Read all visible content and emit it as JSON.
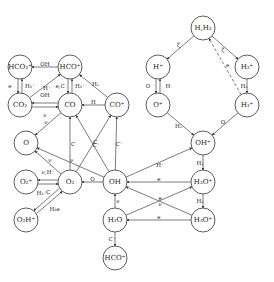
{
  "nodes": [
    {
      "id": "HCO2p",
      "label": "HCO₂⁺",
      "x": 20,
      "y": 67
    },
    {
      "id": "HCOp",
      "label": "HCO⁺",
      "x": 70,
      "y": 67
    },
    {
      "id": "CO2",
      "label": "CO₂",
      "x": 20,
      "y": 105
    },
    {
      "id": "CO",
      "label": "CO",
      "x": 70,
      "y": 105
    },
    {
      "id": "COp",
      "label": "CO⁺",
      "x": 117,
      "y": 105
    },
    {
      "id": "O",
      "label": "O",
      "x": 26,
      "y": 143
    },
    {
      "id": "O2p",
      "label": "O₂⁺",
      "x": 26,
      "y": 182
    },
    {
      "id": "O2",
      "label": "O₂",
      "x": 70,
      "y": 182
    },
    {
      "id": "O2Hp",
      "label": "O₂H⁺",
      "x": 26,
      "y": 220
    },
    {
      "id": "OH",
      "label": "OH",
      "x": 115,
      "y": 182
    },
    {
      "id": "H2O",
      "label": "H₂O",
      "x": 115,
      "y": 220
    },
    {
      "id": "HCOp2",
      "label": "HCO⁺",
      "x": 115,
      "y": 258
    },
    {
      "id": "HH2",
      "label": "H,H₂",
      "x": 203,
      "y": 28
    },
    {
      "id": "Hp",
      "label": "H⁺",
      "x": 158,
      "y": 67
    },
    {
      "id": "H2p",
      "label": "H₂⁺",
      "x": 247,
      "y": 67
    },
    {
      "id": "Op",
      "label": "O⁺",
      "x": 158,
      "y": 105
    },
    {
      "id": "H3p",
      "label": "H₃⁺",
      "x": 247,
      "y": 105
    },
    {
      "id": "OHp",
      "label": "OH⁺",
      "x": 203,
      "y": 143
    },
    {
      "id": "H2Op",
      "label": "H₂O⁺",
      "x": 203,
      "y": 182
    },
    {
      "id": "H3Op",
      "label": "H₃O⁺",
      "x": 203,
      "y": 220
    }
  ],
  "edges": [
    {
      "from": "HCOp",
      "to": "HCO2p",
      "label": "OH"
    },
    {
      "from": "HCO2p",
      "to": "CO2",
      "label": "e"
    },
    {
      "from": "CO2",
      "to": "HCO2p",
      "label": "H₃⁺"
    },
    {
      "from": "CO2",
      "to": "HCOp",
      "label": "H⁺"
    },
    {
      "from": "HCOp",
      "to": "CO",
      "label": "e,C"
    },
    {
      "from": "CO",
      "to": "HCOp",
      "label": "H₃⁺"
    },
    {
      "from": "COp",
      "to": "HCOp",
      "label": "H₂"
    },
    {
      "from": "CO",
      "to": "CO2",
      "label": "OH"
    },
    {
      "from": "CO2",
      "to": "CO",
      "label": "ν"
    },
    {
      "from": "COp",
      "to": "CO",
      "label": "H"
    },
    {
      "from": "CO",
      "to": "O",
      "label": "ν"
    },
    {
      "from": "O2",
      "to": "CO",
      "label": "C"
    },
    {
      "from": "O2",
      "to": "COp",
      "label": "C⁺"
    },
    {
      "from": "OH",
      "to": "CO",
      "label": "C"
    },
    {
      "from": "OH",
      "to": "COp",
      "label": "C⁺"
    },
    {
      "from": "O2",
      "to": "O",
      "label": "ν"
    },
    {
      "from": "OH",
      "to": "O",
      "label": "ν"
    },
    {
      "from": "O2",
      "to": "O2p",
      "label": "ν,H⁺"
    },
    {
      "from": "O2p",
      "to": "O2",
      "label": "C"
    },
    {
      "from": "O2",
      "to": "O2Hp",
      "label": "H₃⁺"
    },
    {
      "from": "O2Hp",
      "to": "O2",
      "label": "H₃e"
    },
    {
      "from": "OH",
      "to": "O2",
      "label": "O"
    },
    {
      "from": "OH",
      "to": "OHp",
      "label": "H⁺"
    },
    {
      "from": "H2Op",
      "to": "OH",
      "label": "e"
    },
    {
      "from": "H3Op",
      "to": "OH",
      "label": "e"
    },
    {
      "from": "H2O",
      "to": "H2Op",
      "label": "ν"
    },
    {
      "from": "H3Op",
      "to": "H2O",
      "label": "e"
    },
    {
      "from": "H2O",
      "to": "OH",
      "label": "ν"
    },
    {
      "from": "H2O",
      "to": "HCOp2",
      "label": "C⁺"
    },
    {
      "from": "OHp",
      "to": "H2Op",
      "label": "H₂"
    },
    {
      "from": "H2Op",
      "to": "H3Op",
      "label": "H₂"
    },
    {
      "from": "HH2",
      "to": "Hp",
      "label": "ζ"
    },
    {
      "from": "HH2",
      "to": "H2p",
      "label": "ζ"
    },
    {
      "from": "H3p",
      "to": "HH2",
      "label": "e",
      "dashed": true
    },
    {
      "from": "H2p",
      "to": "H3p",
      "label": "H₂"
    },
    {
      "from": "Hp",
      "to": "Op",
      "label": "O"
    },
    {
      "from": "Op",
      "to": "Hp",
      "label": "H"
    },
    {
      "from": "Op",
      "to": "OHp",
      "label": "H₂"
    },
    {
      "from": "H3p",
      "to": "OHp",
      "label": "O"
    }
  ]
}
